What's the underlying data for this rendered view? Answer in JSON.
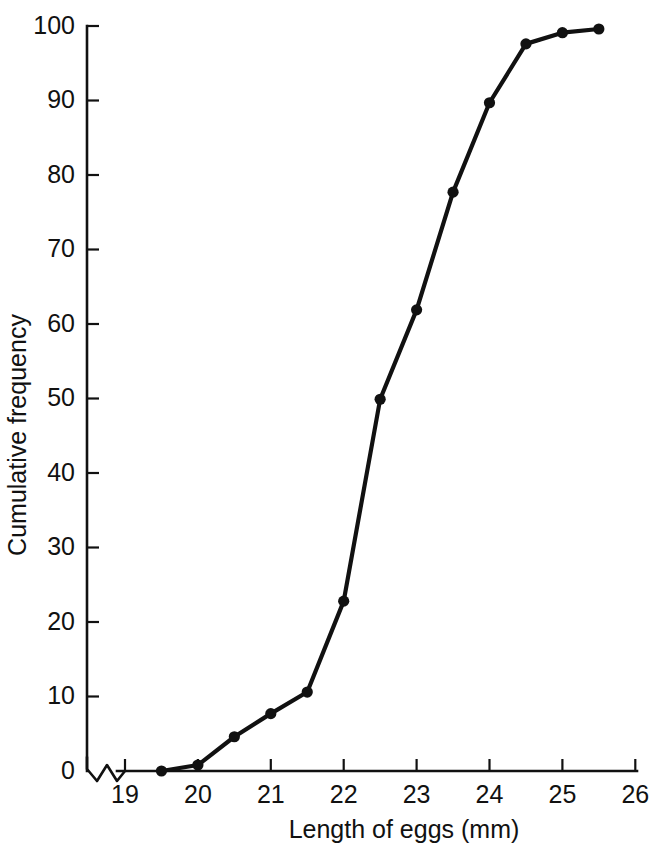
{
  "chart_data": {
    "type": "line",
    "title": "",
    "subtitle": "",
    "xlabel": "Length of eggs (mm)",
    "ylabel": "Cumulative frequency",
    "xlim": [
      19,
      26
    ],
    "ylim": [
      0,
      100
    ],
    "xticks": [
      19,
      20,
      21,
      22,
      23,
      24,
      25,
      26
    ],
    "xtick_labels": [
      "19",
      "20",
      "21",
      "22",
      "23",
      "24",
      "25",
      "26"
    ],
    "yticks": [
      0,
      10,
      20,
      30,
      40,
      50,
      60,
      70,
      80,
      90,
      100
    ],
    "ytick_labels": [
      "0",
      "10",
      "20",
      "30",
      "40",
      "50",
      "60",
      "70",
      "80",
      "90",
      "100"
    ],
    "grid": false,
    "legend": null,
    "axis_break": {
      "axis": "x",
      "symbol": "zigzag",
      "between": [
        0,
        19
      ],
      "note": "Broken x-axis between origin and 19"
    },
    "marker": "filled-circle",
    "x": [
      19.5,
      20.0,
      20.5,
      21.0,
      21.5,
      22.0,
      22.5,
      23.0,
      23.5,
      24.0,
      24.5,
      25.0,
      25.5
    ],
    "values": [
      0.0,
      0.8,
      4.6,
      7.7,
      10.6,
      22.8,
      49.9,
      61.9,
      77.7,
      89.7,
      97.6,
      99.1,
      99.6
    ],
    "series": [
      {
        "name": "Cumulative frequency",
        "x": [
          19.5,
          20.0,
          20.5,
          21.0,
          21.5,
          22.0,
          22.5,
          23.0,
          23.5,
          24.0,
          24.5,
          25.0,
          25.5
        ],
        "values": [
          0.0,
          0.8,
          4.6,
          7.7,
          10.6,
          22.8,
          49.9,
          61.9,
          77.7,
          89.7,
          97.6,
          99.1,
          99.6
        ],
        "color": "#111111"
      }
    ]
  },
  "colors": {
    "ink": "#111111",
    "background": "#ffffff"
  }
}
